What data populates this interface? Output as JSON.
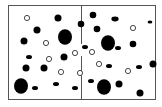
{
  "diagram": {
    "frame": {
      "x": 8,
      "y": 5,
      "width": 147,
      "height": 94,
      "stroke": "#555555"
    },
    "divider": {
      "x": 81,
      "segments": [
        [
          5,
          44
        ],
        [
          56,
          99
        ]
      ],
      "stroke": "#555555"
    },
    "colors": {
      "filled": "#000000",
      "open_stroke": "#333333",
      "open_fill": "#ffffff"
    },
    "particles": [
      {
        "x": 27,
        "y": 18,
        "r": 2.6,
        "kind": "open"
      },
      {
        "x": 58,
        "y": 18,
        "r": 3.5,
        "kind": "filled"
      },
      {
        "x": 37,
        "y": 30,
        "r": 3.5,
        "kind": "filled"
      },
      {
        "x": 65,
        "y": 37,
        "r": 7,
        "kind": "filled"
      },
      {
        "x": 24,
        "y": 41,
        "r": 3.5,
        "kind": "filled"
      },
      {
        "x": 46,
        "y": 43,
        "r": 2.6,
        "kind": "open"
      },
      {
        "x": 81,
        "y": 24,
        "r": 3.3,
        "kind": "filled"
      },
      {
        "x": 93,
        "y": 15,
        "r": 3.3,
        "kind": "filled"
      },
      {
        "x": 97,
        "y": 29,
        "r": 3.3,
        "kind": "filled"
      },
      {
        "x": 115,
        "y": 19,
        "r": 3,
        "kind": "filled_small"
      },
      {
        "x": 133,
        "y": 28,
        "r": 2.6,
        "kind": "open"
      },
      {
        "x": 108,
        "y": 43,
        "r": 7,
        "kind": "filled"
      },
      {
        "x": 133,
        "y": 44,
        "r": 3.3,
        "kind": "filled"
      },
      {
        "x": 118,
        "y": 48,
        "r": 2.5,
        "kind": "filled_small"
      },
      {
        "x": 150,
        "y": 22,
        "r": 2,
        "kind": "filled_small"
      },
      {
        "x": 29,
        "y": 57,
        "r": 2.5,
        "kind": "filled_small"
      },
      {
        "x": 49,
        "y": 59,
        "r": 2.6,
        "kind": "open"
      },
      {
        "x": 64,
        "y": 57,
        "r": 3.5,
        "kind": "filled"
      },
      {
        "x": 92,
        "y": 52,
        "r": 2.6,
        "kind": "open"
      },
      {
        "x": 75,
        "y": 53,
        "r": 2.6,
        "kind": "open"
      },
      {
        "x": 85,
        "y": 47,
        "r": 2.5,
        "kind": "filled_small"
      },
      {
        "x": 153,
        "y": 64,
        "r": 3.5,
        "kind": "filled"
      },
      {
        "x": 26,
        "y": 68,
        "r": 3.5,
        "kind": "filled"
      },
      {
        "x": 44,
        "y": 68,
        "r": 3.5,
        "kind": "filled"
      },
      {
        "x": 61,
        "y": 72,
        "r": 2.6,
        "kind": "open"
      },
      {
        "x": 80,
        "y": 73,
        "r": 2.6,
        "kind": "open"
      },
      {
        "x": 56,
        "y": 84,
        "r": 2.5,
        "kind": "filled_small"
      },
      {
        "x": 21,
        "y": 86,
        "r": 7,
        "kind": "filled"
      },
      {
        "x": 35,
        "y": 88,
        "r": 2.5,
        "kind": "filled_small"
      },
      {
        "x": 75,
        "y": 88,
        "r": 2.5,
        "kind": "filled_small"
      },
      {
        "x": 99,
        "y": 64,
        "r": 2.6,
        "kind": "open"
      },
      {
        "x": 109,
        "y": 66,
        "r": 2.5,
        "kind": "filled_small"
      },
      {
        "x": 128,
        "y": 71,
        "r": 2.6,
        "kind": "open"
      },
      {
        "x": 139,
        "y": 67,
        "r": 2.5,
        "kind": "filled_small"
      },
      {
        "x": 91,
        "y": 81,
        "r": 2.5,
        "kind": "filled_small"
      },
      {
        "x": 104,
        "y": 87,
        "r": 7,
        "kind": "filled"
      },
      {
        "x": 119,
        "y": 84,
        "r": 3.5,
        "kind": "filled"
      },
      {
        "x": 140,
        "y": 93,
        "r": 3.5,
        "kind": "filled"
      },
      {
        "x": 5,
        "y": 32,
        "r": 0,
        "kind": "none"
      }
    ]
  }
}
